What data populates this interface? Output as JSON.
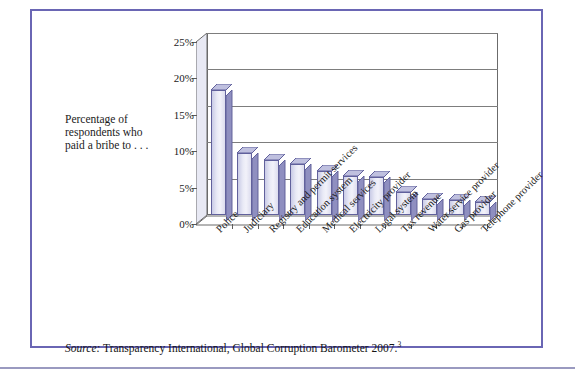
{
  "figure": {
    "caption_lines": [
      "Percentage of",
      "respondents who",
      "paid a bribe to . . ."
    ],
    "source_prefix": "Source:",
    "source_text": " Transparency International, Global Corruption Barometer 2007.",
    "source_footnote": "3",
    "border_color": "#6a66b4"
  },
  "chart_data": {
    "type": "bar",
    "title": "",
    "xlabel": "",
    "ylabel": "Percentage of respondents who paid a bribe to . . .",
    "ylim": [
      0,
      25
    ],
    "ytick_labels": [
      "0%",
      "5%",
      "10%",
      "15%",
      "20%",
      "25%"
    ],
    "ytick_values": [
      0,
      5,
      10,
      15,
      20,
      25
    ],
    "grid": true,
    "legend": "none",
    "bar_color": "#e9eaf6",
    "bar_side_color": "#8f8fc0",
    "bar_edge_color": "#61619c",
    "categories": [
      "Police",
      "Judiciary",
      "Registry and permit services",
      "Education system",
      "Medical services",
      "Electricity provider",
      "Legal system",
      "Tax revenue",
      "Water service provider",
      "Gas provider",
      "Telephone provider"
    ],
    "values": [
      17.2,
      8.5,
      7.6,
      7.0,
      6.1,
      5.4,
      5.2,
      3.1,
      2.2,
      2.0,
      1.8
    ]
  }
}
